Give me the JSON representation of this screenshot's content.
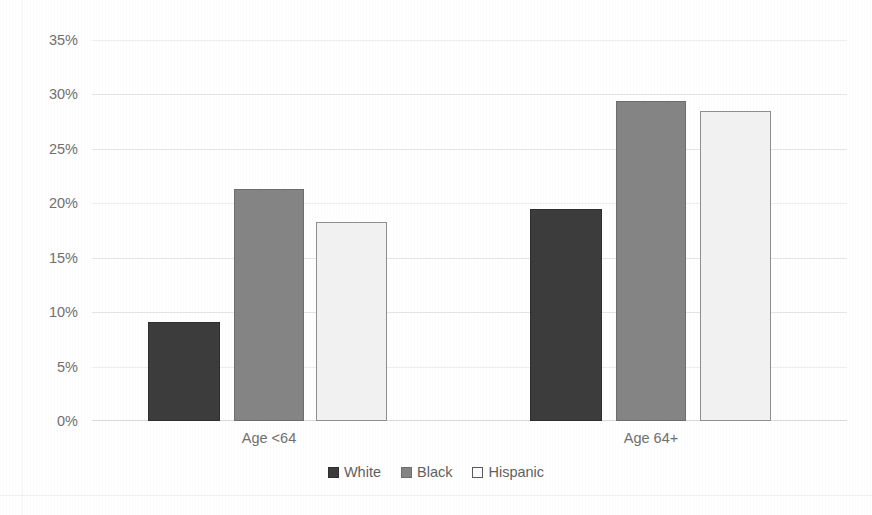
{
  "chart_data": {
    "type": "bar",
    "title": "",
    "subtitle": "",
    "xlabel": "",
    "ylabel": "",
    "categories": [
      "Age <64",
      "Age 64+"
    ],
    "series": [
      {
        "name": "White",
        "values": [
          9.1,
          19.5
        ],
        "color": "#3c3c3c"
      },
      {
        "name": "Black",
        "values": [
          21.3,
          29.4
        ],
        "color": "#848484"
      },
      {
        "name": "Hispanic",
        "values": [
          18.3,
          28.5
        ],
        "color": "#f1f1f1"
      }
    ],
    "ylim": [
      0,
      35
    ],
    "ytick_values": [
      0,
      5,
      10,
      15,
      20,
      25,
      30,
      35
    ],
    "ytick_labels": [
      "0%",
      "5%",
      "10%",
      "15%",
      "20%",
      "25%",
      "30%",
      "35%"
    ],
    "value_format": "percent",
    "grid": true,
    "grid_axis": "y",
    "legend_position": "bottom",
    "annotations": []
  },
  "legend": {
    "items": [
      {
        "label": "White",
        "swatch": "white-series-swatch"
      },
      {
        "label": "Black",
        "swatch": "black-series-swatch"
      },
      {
        "label": "Hispanic",
        "swatch": "hispanic-series-swatch"
      }
    ]
  },
  "colors": {
    "white_series": "#3c3c3c",
    "black_series": "#848484",
    "hispanic_series": "#f1f1f1",
    "gridline": "#e4e4e4",
    "tick_text": "#6f6f6f",
    "background": "#ffffff"
  }
}
